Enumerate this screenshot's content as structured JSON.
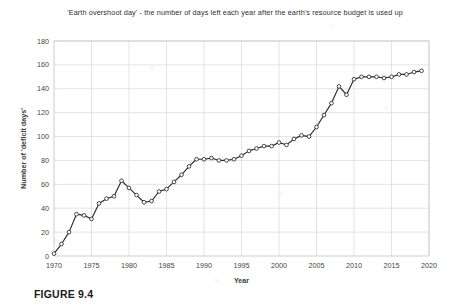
{
  "figure": {
    "caption": "FIGURE 9.4"
  },
  "chart_data": {
    "type": "line",
    "title": "'Earth overshoot day' - the number of days left each year after the earth's resource budget is used up",
    "xlabel": "Year",
    "ylabel": "Number of 'deficit days'",
    "xlim": [
      1970,
      2020
    ],
    "ylim": [
      0,
      180
    ],
    "xticks": [
      1970,
      1975,
      1980,
      1985,
      1990,
      1995,
      2000,
      2005,
      2010,
      2015,
      2020
    ],
    "yticks": [
      0,
      20,
      40,
      60,
      80,
      100,
      120,
      140,
      160,
      180
    ],
    "grid": true,
    "legend": false,
    "line_color": "#2b2b2b",
    "marker": "open-circle",
    "marker_face_color": "#ffffff",
    "x": [
      1970,
      1971,
      1972,
      1973,
      1974,
      1975,
      1976,
      1977,
      1978,
      1979,
      1980,
      1981,
      1982,
      1983,
      1984,
      1985,
      1986,
      1987,
      1988,
      1989,
      1990,
      1991,
      1992,
      1993,
      1994,
      1995,
      1996,
      1997,
      1998,
      1999,
      2000,
      2001,
      2002,
      2003,
      2004,
      2005,
      2006,
      2007,
      2008,
      2009,
      2010,
      2011,
      2012,
      2013,
      2014,
      2015,
      2016,
      2017,
      2018,
      2019
    ],
    "values": [
      2,
      10,
      20,
      35,
      34,
      31,
      44,
      48,
      50,
      63,
      57,
      51,
      45,
      46,
      54,
      56,
      62,
      68,
      75,
      81,
      81,
      82,
      80,
      80,
      81,
      84,
      88,
      90,
      92,
      92,
      95,
      93,
      98,
      101,
      100,
      108,
      118,
      128,
      142,
      135,
      148,
      150,
      150,
      150,
      149,
      150,
      152,
      152,
      154,
      155
    ]
  }
}
